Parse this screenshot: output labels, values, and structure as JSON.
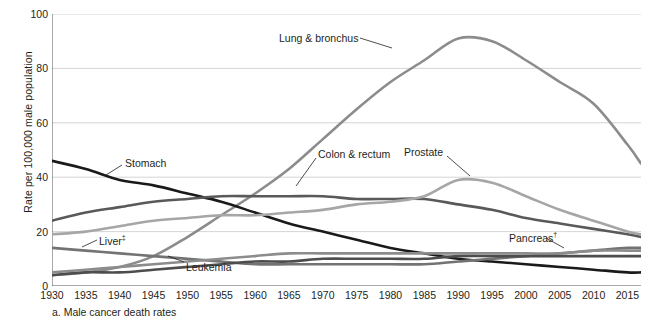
{
  "chart_data": {
    "type": "line",
    "title": "",
    "caption": "a. Male cancer death rates",
    "xlabel": "",
    "ylabel": "Rate per 100,000 male population",
    "xlim": [
      1930,
      2017
    ],
    "ylim": [
      0,
      100
    ],
    "yticks": [
      0,
      20,
      40,
      60,
      80,
      100
    ],
    "xticks": [
      1930,
      1935,
      1940,
      1945,
      1950,
      1955,
      1960,
      1965,
      1970,
      1975,
      1980,
      1985,
      1990,
      1995,
      2000,
      2005,
      2010,
      2015
    ],
    "grid": "horizontal",
    "legend": "inline-annotations",
    "x": [
      1930,
      1935,
      1940,
      1945,
      1950,
      1955,
      1960,
      1965,
      1970,
      1975,
      1980,
      1985,
      1990,
      1995,
      2000,
      2005,
      2010,
      2015,
      2017
    ],
    "series": [
      {
        "name": "Lung & bronchus",
        "color": "#8c8c8c",
        "label_x": 279,
        "label_y": 33,
        "leader": [
          [
            360,
            38
          ],
          [
            392,
            48
          ]
        ],
        "values": [
          4,
          5,
          7,
          11,
          18,
          26,
          34,
          43,
          54,
          65,
          75,
          83,
          91,
          90,
          83,
          75,
          67,
          52,
          45
        ]
      },
      {
        "name": "Stomach",
        "color": "#1a1a1a",
        "label_x": 125,
        "label_y": 158,
        "leader": [
          [
            122,
            165
          ],
          [
            106,
            175
          ]
        ],
        "values": [
          46,
          43,
          39,
          37,
          34,
          31,
          27,
          23,
          20,
          17,
          14,
          12,
          10,
          9,
          8,
          7,
          6,
          5,
          5
        ]
      },
      {
        "name": "Colon & rectum",
        "color": "#595959",
        "label_x": 318,
        "label_y": 149,
        "leader": [
          [
            316,
            158
          ],
          [
            296,
            186
          ]
        ],
        "values": [
          24,
          27,
          29,
          31,
          32,
          33,
          33,
          33,
          33,
          32,
          32,
          32,
          30,
          28,
          25,
          23,
          21,
          19,
          18
        ]
      },
      {
        "name": "Prostate",
        "color": "#a6a6a6",
        "label_x": 404,
        "label_y": 147,
        "leader": [
          [
            447,
            156
          ],
          [
            470,
            176
          ]
        ],
        "values": [
          19,
          20,
          22,
          24,
          25,
          26,
          26,
          27,
          28,
          30,
          31,
          33,
          39,
          38,
          33,
          28,
          24,
          20,
          19
        ]
      },
      {
        "name": "Liver",
        "dagger": "‡",
        "color": "#737373",
        "label_x": 99,
        "label_y": 234,
        "leader": [
          [
            97,
            240
          ],
          [
            82,
            247
          ]
        ],
        "values": [
          14,
          13,
          12,
          11,
          10,
          9,
          8,
          8,
          8,
          8,
          8,
          8,
          9,
          10,
          11,
          12,
          13,
          14,
          14
        ]
      },
      {
        "name": "Leukemia",
        "color": "#4d4d4d",
        "label_x": 186,
        "label_y": 262,
        "leader": [
          [
            184,
            262
          ],
          [
            168,
            256
          ]
        ],
        "values": [
          4,
          5,
          5,
          6,
          7,
          8,
          9,
          9,
          10,
          10,
          10,
          10,
          11,
          11,
          11,
          11,
          11,
          11,
          11
        ]
      },
      {
        "name": "Pancreas",
        "dagger": "†",
        "color": "#8c8c8c",
        "label_x": 509,
        "label_y": 231,
        "leader": [
          [
            546,
            238
          ],
          [
            564,
            248
          ]
        ],
        "values": [
          5,
          6,
          7,
          8,
          9,
          10,
          11,
          12,
          12,
          12,
          12,
          12,
          12,
          12,
          12,
          12,
          13,
          13,
          13
        ]
      }
    ]
  }
}
